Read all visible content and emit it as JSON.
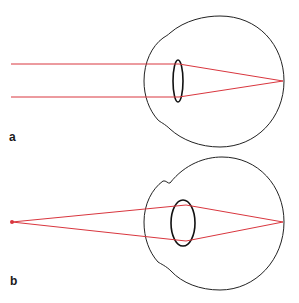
{
  "figure": {
    "panels": [
      {
        "label": "a",
        "description": "Parallel rays from distant object focused on retina by thin (relaxed) lens",
        "ray_color": "#d9363e",
        "outline_color": "#222222"
      },
      {
        "label": "b",
        "description": "Diverging rays from near point source focused on retina by thicker (accommodated) lens",
        "ray_color": "#d9363e",
        "outline_color": "#222222"
      }
    ]
  }
}
